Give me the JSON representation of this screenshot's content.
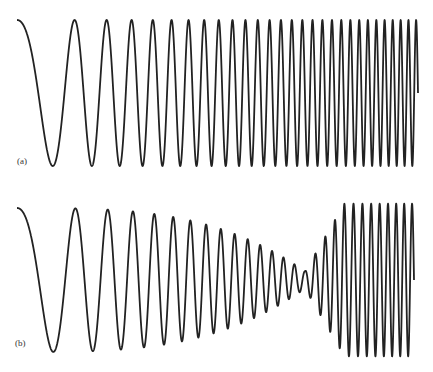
{
  "figure": {
    "panels": [
      {
        "id": "a",
        "label": "(a)",
        "description": "Linear chirp signal (sinusoid with increasing frequency), sampled adequately"
      },
      {
        "id": "b",
        "label": "(b)",
        "description": "Same chirp signal with aliasing: amplitude collapses near the folding frequency then reappears"
      }
    ],
    "stroke_color": "#222222",
    "background": "#ffffff"
  },
  "chart_data": [
    {
      "type": "line",
      "title": "(a)",
      "description": "Chirp: cos(phi(t)), frequency increasing linearly from left to right",
      "x_range_px": [
        17,
        418
      ],
      "y_range_px": [
        20,
        166
      ],
      "approx_cycles": 28,
      "start": "peak at left edge",
      "end": "truncated near midline at right edge"
    },
    {
      "type": "line",
      "title": "(b)",
      "description": "Aliased chirp: amplitude envelope shrinks to near zero around x≈305 px then recovers at high apparent frequency",
      "x_range_px": [
        17,
        414
      ],
      "y_range_px": [
        208,
        353
      ],
      "approx_cycles": 27,
      "amplitude_dip_x_px": 305,
      "start": "peak at left edge",
      "end": "truncated near midline at right edge"
    }
  ]
}
